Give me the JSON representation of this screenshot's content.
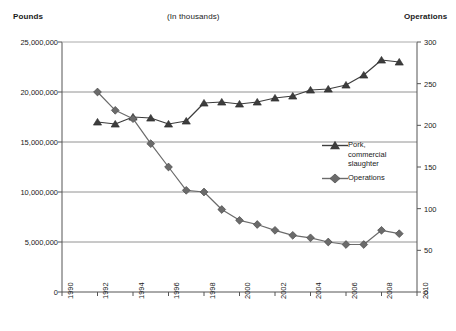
{
  "header": {
    "left_label": "Pounds",
    "center_label": "(In thousands)",
    "right_label": "Operations"
  },
  "legend": {
    "position": "inside-right-middle",
    "entries": [
      {
        "name": "pork-commercial-slaughter",
        "label": "Pork,\ncommercial\nslaughter",
        "marker": "triangle-icon",
        "color": "#3d3d3d"
      },
      {
        "name": "operations",
        "label": "Operations",
        "marker": "diamond-icon",
        "color": "#6b6b6b"
      }
    ]
  },
  "axes": {
    "left": {
      "title": "Pounds",
      "ticks": [
        "0",
        "5,000,000",
        "10,000,000",
        "15,000,000",
        "20,000,000",
        "25,000,000"
      ],
      "values": [
        0,
        5000000,
        10000000,
        15000000,
        20000000,
        25000000
      ],
      "min": 0,
      "max": 25000000
    },
    "right": {
      "title": "Operations",
      "ticks": [
        "0",
        "50",
        "100",
        "150",
        "200",
        "250",
        "300"
      ],
      "values": [
        0,
        50,
        100,
        150,
        200,
        250,
        300
      ],
      "min": 0,
      "max": 300
    },
    "bottom": {
      "ticks": [
        "1990",
        "1992",
        "1994",
        "1996",
        "1998",
        "2000",
        "2002",
        "2004",
        "2006",
        "2008",
        "2010"
      ],
      "values": [
        1990,
        1992,
        1994,
        1996,
        1998,
        2000,
        2002,
        2004,
        2006,
        2008,
        2010
      ],
      "min": 1990,
      "max": 2010
    }
  },
  "chart_data": {
    "type": "line",
    "title": "(In thousands)",
    "xlabel": "",
    "ylabel": "Pounds",
    "y2label": "Operations",
    "xlim": [
      1990,
      2010
    ],
    "ylim": [
      0,
      25000000
    ],
    "y2lim": [
      0,
      300
    ],
    "grid": true,
    "legend_position": "inside-right-middle",
    "x": [
      1992,
      1993,
      1994,
      1995,
      1996,
      1997,
      1998,
      1999,
      2000,
      2001,
      2002,
      2003,
      2004,
      2005,
      2006,
      2007,
      2008,
      2009
    ],
    "series": [
      {
        "name": "Pork, commercial slaughter",
        "axis": "left",
        "units": "pounds (thousands)",
        "marker": "triangle",
        "color": "#3d3d3d",
        "values": [
          17000000,
          16800000,
          17500000,
          17400000,
          16800000,
          17100000,
          18900000,
          19000000,
          18800000,
          19000000,
          19400000,
          19600000,
          20200000,
          20300000,
          20700000,
          21700000,
          23200000,
          23000000
        ]
      },
      {
        "name": "Operations",
        "axis": "right",
        "units": "operations (thousands)",
        "marker": "diamond",
        "color": "#6b6b6b",
        "values": [
          240,
          218,
          208,
          178,
          150,
          122,
          120,
          99,
          86,
          81,
          74,
          68,
          65,
          60,
          57,
          57,
          74,
          70
        ]
      }
    ]
  }
}
